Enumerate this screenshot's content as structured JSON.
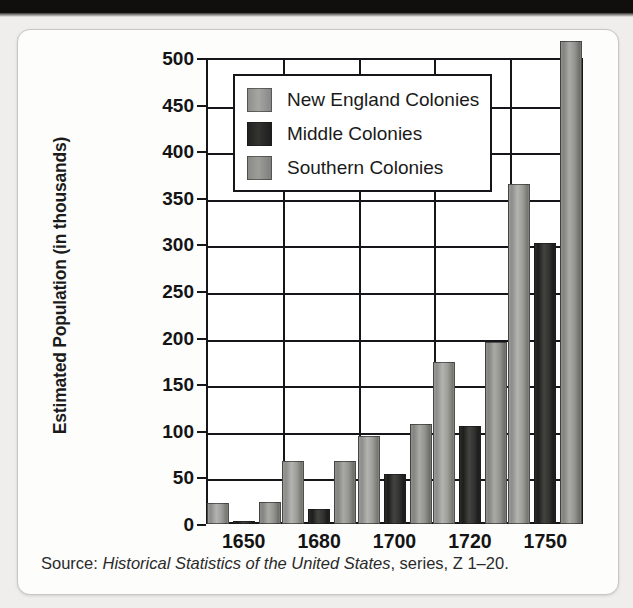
{
  "figure": {
    "source_prefix": "Source:",
    "source_italic": "Historical Statistics of the United States",
    "source_suffix": ", series, Z 1–20."
  },
  "chart_data": {
    "type": "bar",
    "title": "",
    "subtitle": "",
    "xlabel": "",
    "ylabel": "Estimated Population (in thousands)",
    "ylabel_parts": {
      "bold": "Estimated Population",
      "rest": " (in thousands)"
    },
    "categories": [
      "1650",
      "1680",
      "1700",
      "1720",
      "1750"
    ],
    "series": [
      {
        "name": "New England Colonies",
        "color": "#9a9a98",
        "values": [
          23,
          68,
          94,
          174,
          365
        ]
      },
      {
        "name": "Middle Colonies",
        "color": "#26262a",
        "values": [
          3,
          16,
          54,
          105,
          302
        ]
      },
      {
        "name": "Southern Colonies",
        "color": "#8d8d8a",
        "values": [
          24,
          68,
          107,
          195,
          518
        ]
      }
    ],
    "ylim": [
      0,
      500
    ],
    "ytick_labels": [
      "0",
      "50",
      "100",
      "150",
      "200",
      "250",
      "300",
      "350",
      "400",
      "450",
      "500"
    ],
    "ytick_values": [
      0,
      50,
      100,
      150,
      200,
      250,
      300,
      350,
      400,
      450,
      500
    ],
    "ytick_step": 50,
    "grid": true,
    "grid_axis": "both",
    "legend_position": "upper-left-inside",
    "legend_entries": [
      "New England Colonies",
      "Middle Colonies",
      "Southern Colonies"
    ]
  }
}
